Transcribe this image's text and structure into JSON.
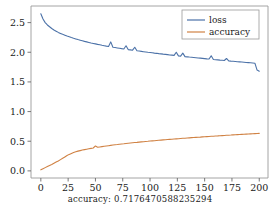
{
  "caption": {
    "text": "accuracy: 0.7176470588235294",
    "label": "accuracy:",
    "value": "0.7176470588235294"
  },
  "colors": {
    "loss": "#4c72a8",
    "accuracy": "#d08244",
    "axis": "#9a9a9a",
    "text": "#1a1a1a",
    "background": "#ffffff",
    "legend_border": "#9a9a9a"
  },
  "legend": {
    "position": "upper right",
    "entries": [
      {
        "label": "loss",
        "color": "#4c72a8"
      },
      {
        "label": "accuracy",
        "color": "#d08244"
      }
    ]
  },
  "axes": {
    "xticks": [
      "0",
      "25",
      "50",
      "75",
      "100",
      "125",
      "150",
      "175",
      "200"
    ],
    "yticks": [
      "0.0",
      "0.5",
      "1.0",
      "1.5",
      "2.0",
      "2.5"
    ]
  },
  "chart_data": {
    "type": "line",
    "title": "",
    "xlabel": "",
    "ylabel": "",
    "xlim": [
      -9,
      208
    ],
    "ylim": [
      -0.12,
      2.78
    ],
    "grid": false,
    "legend_position": "upper right",
    "xticks": [
      0,
      25,
      50,
      75,
      100,
      125,
      150,
      175,
      200
    ],
    "yticks": [
      0.0,
      0.5,
      1.0,
      1.5,
      2.0,
      2.5
    ],
    "x": [
      0,
      2,
      4,
      6,
      8,
      10,
      12,
      14,
      16,
      18,
      20,
      22,
      24,
      26,
      28,
      30,
      32,
      34,
      36,
      38,
      40,
      42,
      44,
      46,
      48,
      50,
      52,
      54,
      56,
      58,
      60,
      62,
      64,
      66,
      68,
      70,
      72,
      74,
      76,
      78,
      80,
      82,
      84,
      86,
      88,
      90,
      92,
      94,
      96,
      98,
      100,
      102,
      104,
      106,
      108,
      110,
      112,
      114,
      116,
      118,
      120,
      122,
      124,
      126,
      128,
      130,
      132,
      134,
      136,
      138,
      140,
      142,
      144,
      146,
      148,
      150,
      152,
      154,
      156,
      158,
      160,
      162,
      164,
      166,
      168,
      170,
      172,
      174,
      176,
      178,
      180,
      182,
      184,
      186,
      188,
      190,
      192,
      194,
      196,
      198,
      200
    ],
    "series": [
      {
        "name": "loss",
        "color": "#4c72a8",
        "values": [
          2.65,
          2.56,
          2.5,
          2.46,
          2.43,
          2.4,
          2.375,
          2.355,
          2.335,
          2.318,
          2.302,
          2.288,
          2.274,
          2.261,
          2.248,
          2.236,
          2.225,
          2.214,
          2.204,
          2.194,
          2.184,
          2.175,
          2.166,
          2.157,
          2.149,
          2.141,
          2.133,
          2.126,
          2.118,
          2.111,
          2.104,
          2.098,
          2.175,
          2.085,
          2.079,
          2.073,
          2.067,
          2.061,
          2.056,
          2.11,
          2.045,
          2.04,
          2.035,
          2.085,
          2.025,
          2.02,
          2.015,
          2.01,
          2.005,
          2.0,
          1.996,
          1.991,
          1.986,
          1.982,
          1.977,
          1.973,
          1.968,
          1.964,
          1.96,
          1.955,
          1.951,
          1.947,
          2.0,
          1.939,
          1.935,
          1.985,
          1.927,
          1.923,
          1.919,
          1.916,
          1.912,
          1.908,
          1.904,
          1.901,
          1.897,
          1.893,
          1.889,
          1.886,
          1.94,
          1.879,
          1.875,
          1.872,
          1.868,
          1.865,
          1.861,
          1.895,
          1.855,
          1.851,
          1.848,
          1.845,
          1.841,
          1.838,
          1.835,
          1.832,
          1.828,
          1.825,
          1.822,
          1.819,
          1.816,
          1.7,
          1.68
        ]
      },
      {
        "name": "accuracy",
        "color": "#d08244",
        "values": [
          0.018,
          0.036,
          0.055,
          0.073,
          0.091,
          0.108,
          0.128,
          0.148,
          0.168,
          0.19,
          0.212,
          0.235,
          0.258,
          0.278,
          0.295,
          0.31,
          0.322,
          0.333,
          0.342,
          0.351,
          0.359,
          0.366,
          0.373,
          0.38,
          0.386,
          0.42,
          0.398,
          0.404,
          0.409,
          0.415,
          0.42,
          0.425,
          0.43,
          0.435,
          0.44,
          0.444,
          0.449,
          0.453,
          0.457,
          0.462,
          0.466,
          0.47,
          0.474,
          0.478,
          0.481,
          0.485,
          0.489,
          0.492,
          0.496,
          0.499,
          0.503,
          0.506,
          0.509,
          0.513,
          0.516,
          0.519,
          0.522,
          0.525,
          0.528,
          0.531,
          0.534,
          0.537,
          0.54,
          0.543,
          0.546,
          0.549,
          0.551,
          0.554,
          0.557,
          0.56,
          0.562,
          0.565,
          0.568,
          0.57,
          0.573,
          0.575,
          0.578,
          0.58,
          0.583,
          0.585,
          0.588,
          0.59,
          0.593,
          0.595,
          0.597,
          0.6,
          0.602,
          0.604,
          0.607,
          0.609,
          0.611,
          0.613,
          0.616,
          0.618,
          0.62,
          0.622,
          0.624,
          0.626,
          0.628,
          0.63,
          0.632
        ]
      }
    ]
  }
}
